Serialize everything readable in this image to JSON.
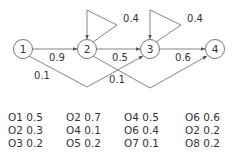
{
  "diagram": {
    "nodes": [
      {
        "id": "1",
        "label": "1",
        "cx": 23,
        "cy": 49
      },
      {
        "id": "2",
        "label": "2",
        "cx": 87,
        "cy": 49
      },
      {
        "id": "3",
        "label": "3",
        "cx": 150,
        "cy": 49
      },
      {
        "id": "4",
        "label": "4",
        "cx": 215,
        "cy": 49
      }
    ],
    "edges": [
      {
        "from": "1",
        "to": "2",
        "label": "0.9"
      },
      {
        "from": "2",
        "to": "3",
        "label": "0.5"
      },
      {
        "from": "3",
        "to": "4",
        "label": "0.6"
      },
      {
        "from": "2",
        "to": "2",
        "label": "0.4"
      },
      {
        "from": "3",
        "to": "3",
        "label": "0.4"
      },
      {
        "from": "1",
        "to": "3",
        "label": "0.1"
      },
      {
        "from": "2",
        "to": "4",
        "label": "0.1"
      }
    ]
  },
  "emissions": {
    "columns": [
      {
        "state": "1",
        "rows": [
          {
            "symbol": "O1",
            "prob": "0.5",
            "text": "O1 0.5"
          },
          {
            "symbol": "O2",
            "prob": "0.3",
            "text": "O2 0.3"
          },
          {
            "symbol": "O3",
            "prob": "0.2",
            "text": "O3 0.2"
          }
        ]
      },
      {
        "state": "2",
        "rows": [
          {
            "symbol": "O2",
            "prob": "0.7",
            "text": "O2 0.7"
          },
          {
            "symbol": "O4",
            "prob": "0.1",
            "text": "O4 0.1"
          },
          {
            "symbol": "O5",
            "prob": "0.2",
            "text": "O5 0.2"
          }
        ]
      },
      {
        "state": "3",
        "rows": [
          {
            "symbol": "O4",
            "prob": "0.5",
            "text": "O4 0.5"
          },
          {
            "symbol": "O6",
            "prob": "0.4",
            "text": "O6 0.4"
          },
          {
            "symbol": "O7",
            "prob": "0.1",
            "text": "O7 0.1"
          }
        ]
      },
      {
        "state": "4",
        "rows": [
          {
            "symbol": "O6",
            "prob": "0.6",
            "text": "O6 0.6"
          },
          {
            "symbol": "O2",
            "prob": "0.2",
            "text": "O2 0.2"
          },
          {
            "symbol": "O8",
            "prob": "0.2",
            "text": "O8 0.2"
          }
        ]
      }
    ]
  }
}
